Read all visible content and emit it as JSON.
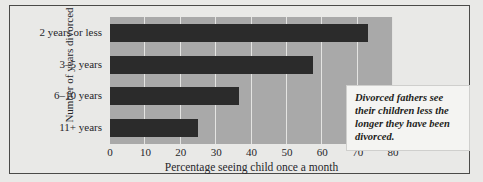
{
  "chart_data": {
    "type": "bar",
    "orientation": "horizontal",
    "title": "",
    "xlabel": "Percentage seeing child once a month",
    "ylabel": "Number of years divorced",
    "categories": [
      "2 years or less",
      "3–5 years",
      "6–10 years",
      "11+ years"
    ],
    "values": [
      73,
      57.5,
      36.5,
      25
    ],
    "xlim": [
      0,
      80
    ],
    "xticks": [
      0,
      10,
      20,
      30,
      40,
      50,
      60,
      70,
      80
    ],
    "xtick_labels": [
      "0",
      "10",
      "20",
      "30",
      "40",
      "50",
      "60",
      "70",
      "80"
    ],
    "grid": "vertical-white-gridlines",
    "legend": "none",
    "annotations": [
      {
        "text": "Divorced fathers see their children less the longer they have been divorced.",
        "style": "italic-bold-serif",
        "box": "white"
      }
    ],
    "colors": {
      "bar": "#2b2b2b",
      "plot_background": "#a9a9a9",
      "gridline": "#e4e4e2",
      "figure_background": "#e9e9e7",
      "frame_border": "#4a4a48",
      "annotation_background": "#f4f4f2",
      "text": "#26262a"
    }
  }
}
